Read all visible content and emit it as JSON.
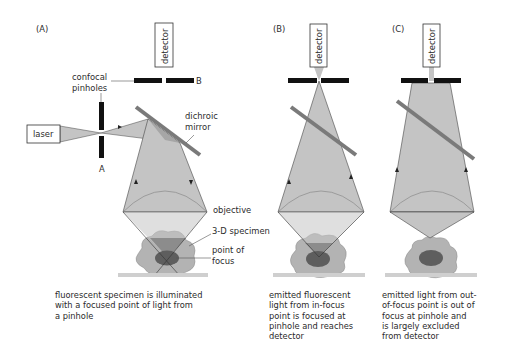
{
  "panels": {
    "a": {
      "tag": "(A)",
      "detector": "detector",
      "pinholes_label_1": "confocal",
      "pinholes_label_2": "pinholes",
      "pinhole_a": "A",
      "pinhole_b": "B",
      "laser": "laser",
      "mirror_1": "dichroic",
      "mirror_2": "mirror",
      "objective": "objective",
      "specimen": "3-D specimen",
      "focus_1": "point of",
      "focus_2": "focus",
      "caption": "fluorescent specimen is illuminated\nwith a focused point of light from\na pinhole"
    },
    "b": {
      "tag": "(B)",
      "detector": "detector",
      "caption": "emitted fluorescent\nlight from in-focus\npoint is focused at\npinhole and reaches\ndetector"
    },
    "c": {
      "tag": "(C)",
      "detector": "detector",
      "caption": "emitted light from out-\nof-focus point is out of\nfocus at pinhole and\nis largely excluded\nfrom detector"
    }
  },
  "colors": {
    "beam": "#c4c4c4",
    "beam_dark": "#a6a6a6",
    "mirror": "#7a7a7a",
    "specimen": "#b3b3b3",
    "specimen_edge": "#8a8a8a",
    "focus": "#5e5e5e",
    "stage": "#cfcfcf",
    "bar": "#111111"
  }
}
